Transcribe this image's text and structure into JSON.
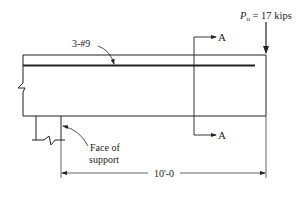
{
  "diagram": {
    "type": "cantilever beam elevation",
    "load": {
      "symbol": "P",
      "subscript": "u",
      "value_text": " = 17 kips"
    },
    "rebar_label": "3-#9",
    "section_marks": {
      "top": "A",
      "bottom": "A"
    },
    "support_label_line1": "Face of",
    "support_label_line2": "support",
    "dimension": "10'-0",
    "colors": {
      "line": "#222222",
      "background": "#ffffff"
    }
  }
}
